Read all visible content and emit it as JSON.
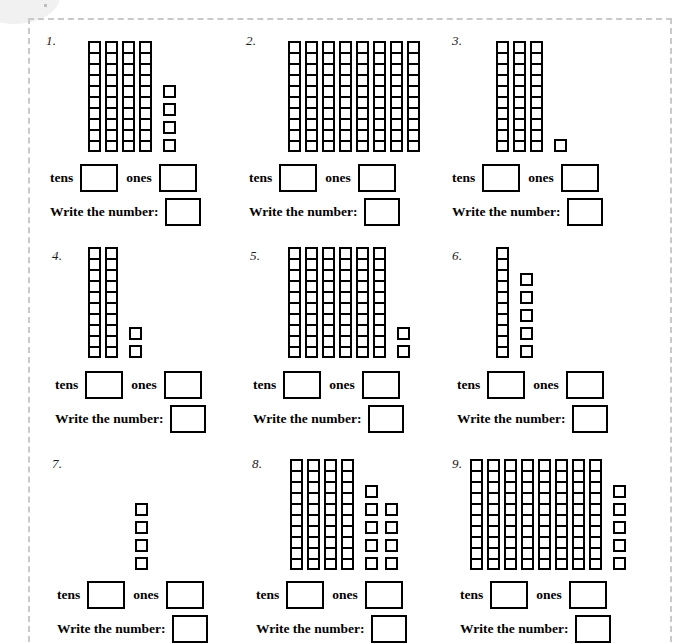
{
  "worksheet": {
    "labels": {
      "tens": "tens",
      "ones": "ones",
      "write_the_number": "Write the number:"
    },
    "colors": {
      "block_outline": "#000000",
      "page_background": "#ffffff",
      "frame_dashed": "#c9c9c9",
      "text": "#000000"
    },
    "problems": [
      {
        "number": "1.",
        "rods": 4,
        "cells_per_rod": 10,
        "ones_columns": [
          4
        ],
        "ones_total": 4,
        "tens_value": 4,
        "answer": 44
      },
      {
        "number": "2.",
        "rods": 8,
        "cells_per_rod": 10,
        "ones_columns": [],
        "ones_total": 0,
        "tens_value": 8,
        "answer": 80
      },
      {
        "number": "3.",
        "rods": 3,
        "cells_per_rod": 10,
        "ones_columns": [
          1
        ],
        "ones_total": 1,
        "tens_value": 3,
        "answer": 31
      },
      {
        "number": "4.",
        "rods": 2,
        "cells_per_rod": 10,
        "ones_columns": [
          2
        ],
        "ones_total": 2,
        "tens_value": 2,
        "answer": 22
      },
      {
        "number": "5.",
        "rods": 6,
        "cells_per_rod": 10,
        "ones_columns": [
          2
        ],
        "ones_total": 2,
        "tens_value": 6,
        "answer": 62
      },
      {
        "number": "6.",
        "rods": 1,
        "cells_per_rod": 10,
        "ones_columns": [
          5
        ],
        "ones_total": 5,
        "tens_value": 1,
        "answer": 15
      },
      {
        "number": "7.",
        "rods": 0,
        "cells_per_rod": 10,
        "ones_columns": [
          4
        ],
        "ones_total": 4,
        "tens_value": 0,
        "answer": 4
      },
      {
        "number": "8.",
        "rods": 4,
        "cells_per_rod": 10,
        "ones_columns": [
          5,
          4
        ],
        "ones_total": 9,
        "tens_value": 4,
        "answer": 49
      },
      {
        "number": "9.",
        "rods": 8,
        "cells_per_rod": 10,
        "ones_columns": [
          5
        ],
        "ones_total": 5,
        "tens_value": 8,
        "answer": 85
      }
    ],
    "field_values": {
      "tens_input": "",
      "ones_input": "",
      "number_input": ""
    }
  }
}
